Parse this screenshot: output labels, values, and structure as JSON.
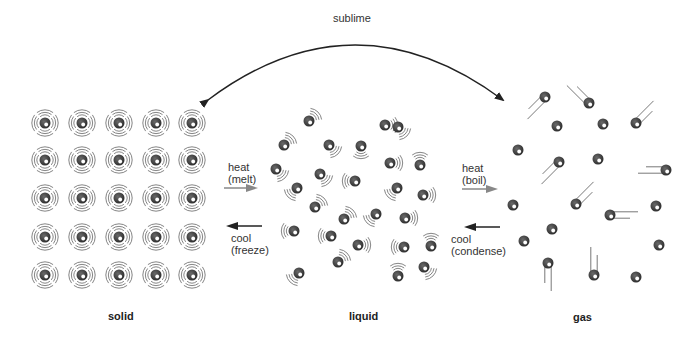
{
  "labels": {
    "sublime": "sublime",
    "heat_melt_1": "heat",
    "heat_melt_2": "(melt)",
    "cool_freeze_1": "cool",
    "cool_freeze_2": "(freeze)",
    "heat_boil_1": "heat",
    "heat_boil_2": "(boil)",
    "cool_condense_1": "cool",
    "cool_condense_2": "(condense)",
    "solid": "solid",
    "liquid": "liquid",
    "gas": "gas"
  },
  "colors": {
    "molecule": "#3a3a3a",
    "highlight": "#ffffff",
    "vibration": "#666666",
    "arrow_heat": "#777777",
    "arrow_cool": "#222222",
    "text": "#333333"
  },
  "solid": {
    "columns": [
      45,
      82,
      119,
      156,
      192
    ],
    "rows": [
      123,
      160,
      198,
      237,
      275
    ]
  },
  "liquid": {
    "molecules": [
      [
        309,
        121,
        "ur"
      ],
      [
        385,
        125,
        "r"
      ],
      [
        398,
        127,
        "dr"
      ],
      [
        284,
        145,
        "ur"
      ],
      [
        329,
        145,
        "dr"
      ],
      [
        361,
        146,
        "d"
      ],
      [
        390,
        163,
        "r"
      ],
      [
        420,
        165,
        "u"
      ],
      [
        276,
        169,
        "dr"
      ],
      [
        320,
        174,
        "dr"
      ],
      [
        355,
        181,
        "l"
      ],
      [
        397,
        188,
        "dl"
      ],
      [
        423,
        195,
        "r"
      ],
      [
        297,
        188,
        "dl"
      ],
      [
        315,
        207,
        "ur"
      ],
      [
        344,
        219,
        "ur"
      ],
      [
        376,
        214,
        "dl"
      ],
      [
        405,
        218,
        "r"
      ],
      [
        294,
        231,
        "l"
      ],
      [
        331,
        236,
        "l"
      ],
      [
        358,
        245,
        "r"
      ],
      [
        404,
        247,
        "l"
      ],
      [
        431,
        246,
        "u"
      ],
      [
        338,
        262,
        "ur"
      ],
      [
        398,
        276,
        "u"
      ],
      [
        299,
        273,
        "dl"
      ],
      [
        424,
        267,
        "dr"
      ]
    ]
  },
  "gas": {
    "molecules": [
      [
        545,
        97,
        "dl"
      ],
      [
        589,
        103,
        "ul"
      ],
      [
        557,
        126,
        "n"
      ],
      [
        603,
        124,
        "n"
      ],
      [
        636,
        123,
        "ur"
      ],
      [
        518,
        150,
        "n"
      ],
      [
        559,
        162,
        "dl"
      ],
      [
        598,
        159,
        "n"
      ],
      [
        666,
        170,
        "l"
      ],
      [
        513,
        205,
        "n"
      ],
      [
        576,
        204,
        "ur"
      ],
      [
        610,
        215,
        "r"
      ],
      [
        656,
        206,
        "n"
      ],
      [
        552,
        229,
        "n"
      ],
      [
        524,
        241,
        "n"
      ],
      [
        659,
        245,
        "n"
      ],
      [
        548,
        263,
        "d"
      ],
      [
        594,
        275,
        "u"
      ],
      [
        636,
        277,
        "n"
      ]
    ]
  }
}
